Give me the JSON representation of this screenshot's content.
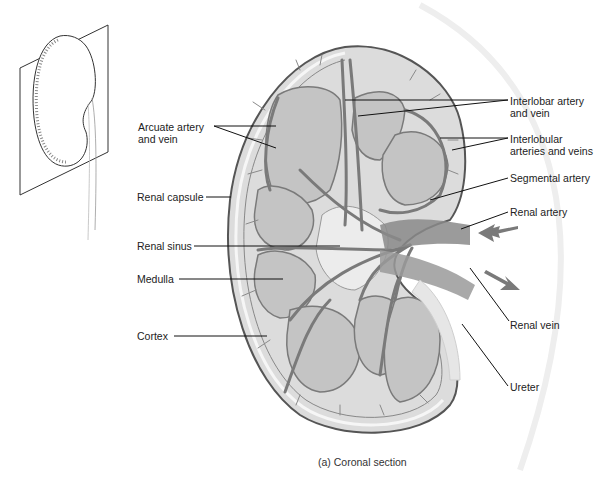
{
  "figure": {
    "caption": "(a) Coronal section",
    "inset": "kidney-in-coronal-plane-icon",
    "labels_left": {
      "arcuate": [
        "Arcuate artery",
        "and vein"
      ],
      "capsule": "Renal capsule",
      "sinus": "Renal sinus",
      "medulla": "Medulla",
      "cortex": "Cortex"
    },
    "labels_right": {
      "interlobar": [
        "Interlobar artery",
        "and vein"
      ],
      "interlobular": [
        "Interlobular",
        "arteries and veins"
      ],
      "segmental": "Segmental artery",
      "renal_artery": "Renal artery",
      "renal_vein": "Renal vein",
      "ureter": "Ureter"
    },
    "colors": {
      "outline": "#555555",
      "cortex_fill": "#e2e2e2",
      "medulla_fill": "#c8c8c8",
      "vessel": "#7a7a7a",
      "arrow": "#7a7a7a",
      "leader": "#111111"
    }
  }
}
